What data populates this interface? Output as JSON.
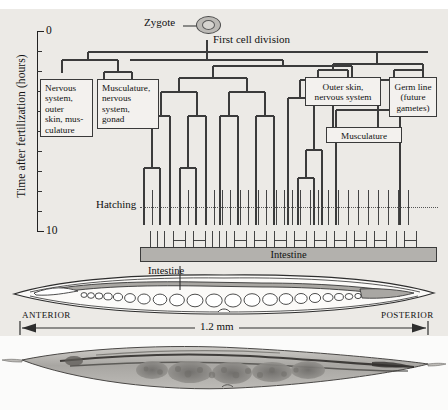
{
  "figure": {
    "cropped_top_text": "",
    "background_color": "#eceae6"
  },
  "axis": {
    "title": "Time after fertilization (hours)",
    "top_label": "0",
    "bottom_label": "10",
    "ticks": 11,
    "range_hours": [
      0,
      10
    ]
  },
  "tree": {
    "zygote_label": "Zygote",
    "first_division_label": "First cell division",
    "hatching_label": "Hatching",
    "intestine_bar_label": "Intestine",
    "fate_boxes": [
      {
        "id": "fate-nervous-outer-skin",
        "text": "Nervous system, outer skin, mus-culature",
        "lines": [
          "Nervous",
          "system,",
          "outer",
          "skin, mus-",
          "culature"
        ]
      },
      {
        "id": "fate-musculature-nervous-gonad",
        "text": "Musculature, nervous system, gonad",
        "lines": [
          "Musculature,",
          "nervous",
          "system,",
          "gonad"
        ]
      },
      {
        "id": "fate-outer-skin-nervous",
        "text": "Outer skin, nervous system",
        "lines": [
          "Outer skin,",
          "nervous system"
        ]
      },
      {
        "id": "fate-germ-line",
        "text": "Germ line (future gametes)",
        "lines": [
          "Germ line",
          "(future",
          "gametes)"
        ]
      },
      {
        "id": "fate-musculature",
        "text": "Musculature",
        "lines": [
          "Musculature"
        ]
      }
    ]
  },
  "worm": {
    "intestine_callout": "Intestine",
    "anterior_label": "ANTERIOR",
    "posterior_label": "POSTERIOR",
    "scale_label": "1.2 mm"
  },
  "colors": {
    "background": "#eceae6",
    "line": "#333333",
    "intestine_fill": "#b3b1ad",
    "box_fill": "#f3f1ee",
    "zygote_fill": "#bcbab6"
  }
}
